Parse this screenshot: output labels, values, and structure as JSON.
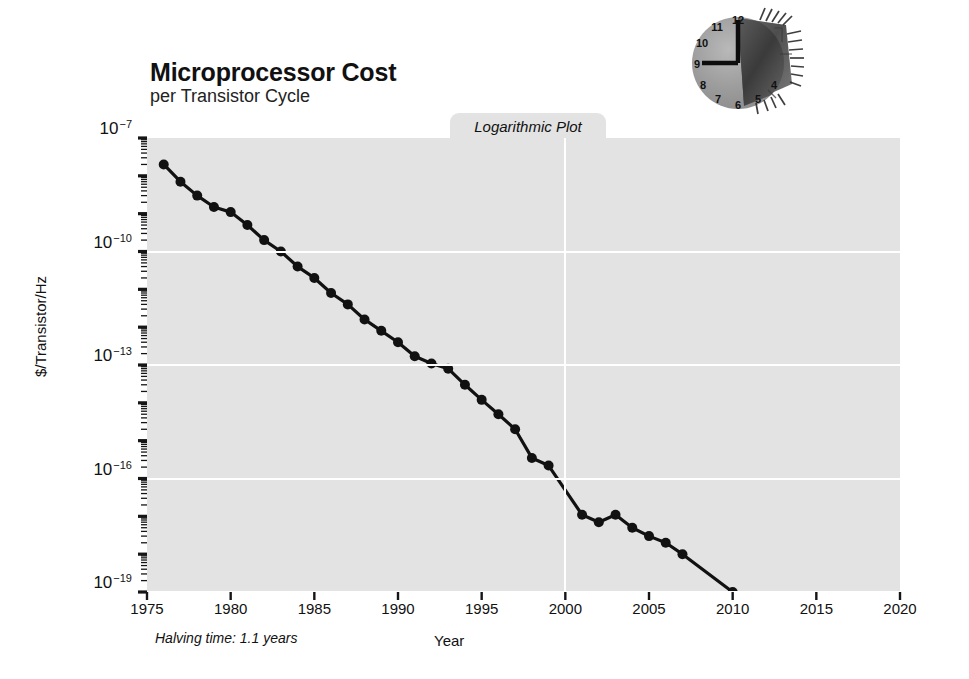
{
  "header": {
    "title": "Microprocessor Cost",
    "subtitle": "per Transistor Cycle"
  },
  "tab": {
    "label": "Logarithmic Plot"
  },
  "annotations": {
    "halving_time": "Halving time: 1.1 years"
  },
  "logo": {
    "name": "clock-microchip-logo",
    "clock_numerals": [
      "12",
      "11",
      "10",
      "9",
      "8",
      "7",
      "6",
      "5",
      "4"
    ],
    "hands": "12 and 9"
  },
  "colors": {
    "plot_background": "#e3e3e3",
    "page_background": "#ffffff",
    "gridline": "#ffffff",
    "series": "#111111",
    "text": "#111111"
  },
  "chart_data": {
    "type": "line",
    "title": "Microprocessor Cost",
    "subtitle": "per Transistor Cycle",
    "xlabel": "Year",
    "ylabel": "$/Transistor/Hz",
    "yscale": "log",
    "xscale": "linear",
    "xlim": [
      1975,
      2020
    ],
    "ylim": [
      1e-19,
      1e-07
    ],
    "xticks": [
      1975,
      1980,
      1985,
      1990,
      1995,
      2000,
      2005,
      2010,
      2015,
      2020
    ],
    "xtick_labels": [
      "1975",
      "1980",
      "1985",
      "1990",
      "1995",
      "2000",
      "2005",
      "2010",
      "2015",
      "2020"
    ],
    "ytick_exponents": [
      -7,
      -10,
      -13,
      -16,
      -19
    ],
    "ytick_labels": [
      "10−7",
      "10−10",
      "10−13",
      "10−16",
      "10−19"
    ],
    "grid": "major horizontal and vertical, white",
    "legend": "none",
    "annotation": "Halving time: 1.1 years",
    "marker": "filled circle",
    "series": [
      {
        "name": "$/Transistor/Hz",
        "x": [
          1976,
          1977,
          1978,
          1979,
          1980,
          1981,
          1982,
          1983,
          1984,
          1985,
          1986,
          1987,
          1988,
          1989,
          1990,
          1991,
          1992,
          1993,
          1994,
          1995,
          1996,
          1997,
          1998,
          1999,
          2001,
          2002,
          2003,
          2004,
          2005,
          2006,
          2007,
          2010,
          2013,
          2016
        ],
        "y": [
          2e-08,
          7e-09,
          3e-09,
          1.5e-09,
          1.1e-09,
          5e-10,
          2e-10,
          1e-10,
          4e-11,
          2e-11,
          8e-12,
          4e-12,
          1.6e-12,
          8e-13,
          4e-13,
          1.7e-13,
          1.1e-13,
          8e-14,
          3e-14,
          1.2e-14,
          5e-15,
          2e-15,
          3.5e-16,
          2.2e-16,
          1.1e-17,
          7e-18,
          1.1e-17,
          5e-18,
          3e-18,
          2e-18,
          1e-18,
          1e-19,
          2e-20,
          2e-21
        ]
      }
    ]
  }
}
